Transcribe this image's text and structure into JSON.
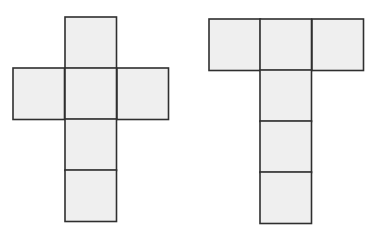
{
  "style": {
    "fill": "#efefef",
    "stroke": "#2f2f2f",
    "stroke_width": 1.6,
    "background": "#ffffff"
  },
  "square_size": 51.5,
  "nets": [
    {
      "name": "cross-net",
      "shape": "cross",
      "squares": [
        {
          "x": 65,
          "y": 17
        },
        {
          "x": 13,
          "y": 68
        },
        {
          "x": 65,
          "y": 68
        },
        {
          "x": 117,
          "y": 68
        },
        {
          "x": 65,
          "y": 119
        },
        {
          "x": 65,
          "y": 170
        }
      ]
    },
    {
      "name": "t-net",
      "shape": "T",
      "squares": [
        {
          "x": 209,
          "y": 19
        },
        {
          "x": 260,
          "y": 19
        },
        {
          "x": 312,
          "y": 19
        },
        {
          "x": 260,
          "y": 70
        },
        {
          "x": 260,
          "y": 121
        },
        {
          "x": 260,
          "y": 172
        }
      ]
    }
  ]
}
